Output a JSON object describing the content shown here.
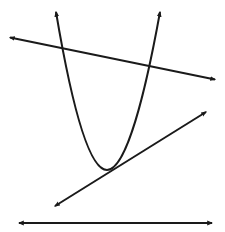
{
  "diagram": {
    "stroke_color": "#1a1a1a",
    "background": "#ffffff",
    "elements": [
      {
        "id": "parabola",
        "type": "parabola",
        "vertex": [
          107,
          170
        ],
        "left_tip": [
          56,
          10
        ],
        "right_tip": [
          160,
          10
        ],
        "intersections_with_secant": 2
      },
      {
        "id": "secant-line",
        "type": "line",
        "from": [
          8,
          37
        ],
        "to": [
          217,
          80
        ],
        "intersections_with_parabola": 2
      },
      {
        "id": "tangent-line",
        "type": "line",
        "from": [
          53,
          207
        ],
        "to": [
          208,
          111
        ],
        "intersections_with_parabola": 1
      },
      {
        "id": "disjoint-line",
        "type": "line",
        "from": [
          17,
          223
        ],
        "to": [
          214,
          223
        ],
        "intersections_with_parabola": 0
      }
    ]
  }
}
